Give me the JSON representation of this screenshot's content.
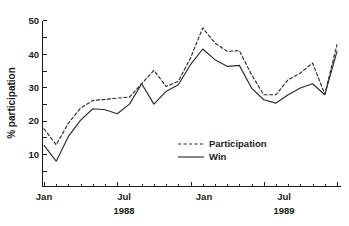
{
  "chart_data": {
    "type": "line",
    "title": "",
    "xlabel": "",
    "ylabel": "% participation",
    "ylim": [
      0,
      50
    ],
    "yticks": [
      10,
      20,
      30,
      40,
      50
    ],
    "ytick_labels": [
      "10",
      "20",
      "30",
      "40",
      "50"
    ],
    "grid": false,
    "legend_position": "center-right-inside",
    "x": [
      "1988-01",
      "1988-02",
      "1988-03",
      "1988-04",
      "1988-05",
      "1988-06",
      "1988-07",
      "1988-08",
      "1988-09",
      "1988-10",
      "1988-11",
      "1988-12",
      "1989-01",
      "1989-02",
      "1989-03",
      "1989-04",
      "1989-05",
      "1989-06",
      "1989-07",
      "1989-08",
      "1989-09",
      "1989-10",
      "1989-11",
      "1989-12",
      "1990-01"
    ],
    "xtick_labels": [
      "Jan",
      "Jul",
      "Jan",
      "Jul"
    ],
    "xtick_positions": [
      "1988-01",
      "1988-07",
      "1989-01",
      "1989-07"
    ],
    "year_labels": [
      "1988",
      "1989"
    ],
    "series": [
      {
        "name": "Participation",
        "style": "dashed",
        "color": "#2b2b2b",
        "values": [
          17.8,
          13.0,
          19.5,
          24.0,
          26.3,
          26.6,
          27.0,
          27.3,
          31.3,
          35.3,
          30.5,
          32.0,
          39.0,
          48.0,
          43.5,
          41.0,
          41.2,
          34.0,
          28.0,
          28.0,
          32.5,
          34.5,
          37.5,
          28.2,
          43.0
        ]
      },
      {
        "name": "Win",
        "style": "solid",
        "color": "#2b2b2b",
        "values": [
          12.8,
          8.1,
          15.5,
          20.4,
          23.8,
          23.5,
          22.3,
          25.2,
          31.3,
          25.2,
          29.0,
          31.0,
          37.0,
          41.7,
          38.5,
          36.5,
          36.8,
          30.0,
          26.5,
          25.5,
          28.0,
          30.0,
          31.3,
          28.0,
          41.0
        ]
      }
    ]
  },
  "legend": {
    "items": [
      {
        "label": "Participation",
        "style": "dashed"
      },
      {
        "label": "Win",
        "style": "solid"
      }
    ]
  },
  "axes": {
    "y_title": "% participation",
    "y_labels": [
      "50",
      "40",
      "30",
      "20",
      "10"
    ],
    "x_labels": [
      "Jan",
      "Jul",
      "Jan",
      "Jul"
    ],
    "x_year_labels": [
      "1988",
      "1989"
    ]
  }
}
